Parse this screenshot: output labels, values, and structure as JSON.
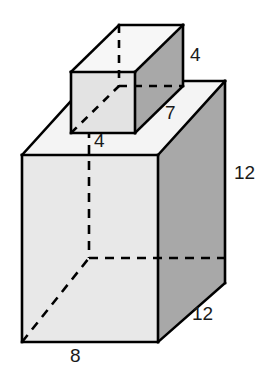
{
  "figure": {
    "background_color": "#ffffff",
    "colors": {
      "outline": "#000000",
      "front_face": "#e8e8e8",
      "side_face": "#a8a8a8",
      "top_face": "#f4f4f4",
      "hidden_edge": "#000000",
      "label_text": "#1a1a1a"
    },
    "shapes": [
      {
        "name": "large-prism",
        "label": "Large rectangular prism",
        "dimensions": {
          "width": "8",
          "height": "12",
          "depth": "12"
        }
      },
      {
        "name": "small-prism",
        "label": "Small rectangular prism",
        "dimensions": {
          "width": "4",
          "height": "4",
          "depth": "7"
        }
      }
    ],
    "labels": {
      "small_height": "4",
      "small_depth": "7",
      "small_width": "4",
      "large_height": "12",
      "large_depth": "12",
      "large_width": "8"
    }
  }
}
